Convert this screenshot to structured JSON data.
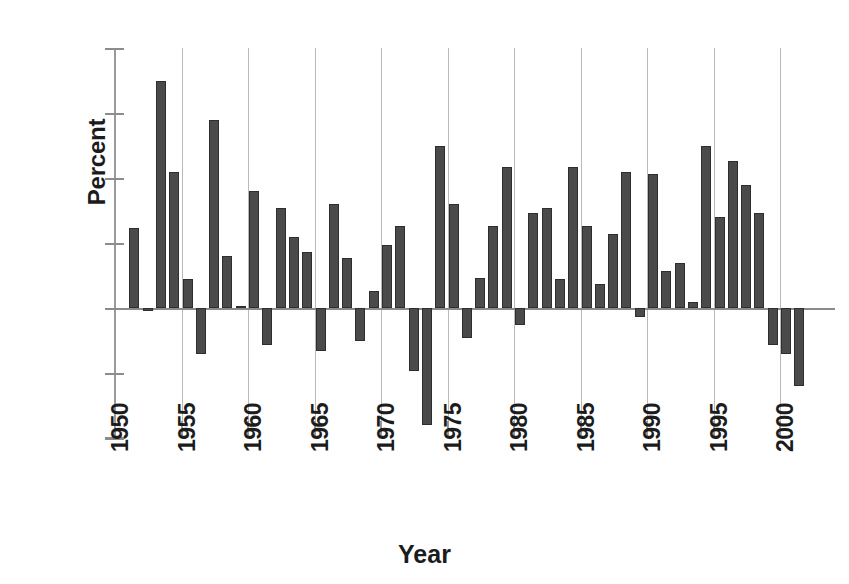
{
  "chart_data": {
    "type": "bar",
    "title": "",
    "subtitle": "",
    "xlabel": "Year",
    "ylabel": "Percent",
    "grid": "vertical-only",
    "legend": "none",
    "bar_color": "#4a4a4a",
    "xlim": [
      1950,
      2003
    ],
    "ylim": [
      -30,
      60
    ],
    "ytick_labels": [
      "60",
      "45",
      "30",
      "15",
      "0",
      "-15",
      "-30"
    ],
    "ytick_values": [
      60,
      45,
      30,
      15,
      0,
      -15,
      -30
    ],
    "xtick_labels": [
      "1950",
      "1955",
      "1960",
      "1965",
      "1970",
      "1975",
      "1980",
      "1985",
      "1990",
      "1995",
      "2000"
    ],
    "xtick_values": [
      1950,
      1955,
      1960,
      1965,
      1970,
      1975,
      1980,
      1985,
      1990,
      1995,
      2000
    ],
    "categories": [
      1951,
      1952,
      1953,
      1954,
      1955,
      1956,
      1957,
      1958,
      1959,
      1960,
      1961,
      1962,
      1963,
      1964,
      1965,
      1966,
      1967,
      1968,
      1969,
      1970,
      1971,
      1972,
      1973,
      1974,
      1975,
      1976,
      1977,
      1978,
      1979,
      1980,
      1981,
      1982,
      1983,
      1984,
      1985,
      1986,
      1987,
      1988,
      1989,
      1990,
      1991,
      1992,
      1993,
      1994,
      1995,
      1996,
      1997,
      1998,
      1999,
      2000,
      2001,
      2002
    ],
    "values": [
      18.5,
      -0.8,
      52.5,
      31.5,
      6.8,
      -10.5,
      43.5,
      12.0,
      0.5,
      27.0,
      -8.5,
      23.0,
      16.5,
      13.0,
      -10.0,
      24.0,
      11.5,
      -7.5,
      4.0,
      14.5,
      19.0,
      -14.5,
      -27.0,
      37.5,
      24.0,
      -7.0,
      7.0,
      19.0,
      32.5,
      -4.0,
      22.0,
      23.0,
      6.8,
      32.5,
      19.0,
      5.5,
      17.0,
      31.5,
      -2.0,
      31.0,
      8.5,
      10.5,
      1.5,
      37.5,
      21.0,
      34.0,
      28.5,
      22.0,
      -8.5,
      -10.5,
      -18.0,
      0
    ],
    "series_name": "Percent"
  }
}
